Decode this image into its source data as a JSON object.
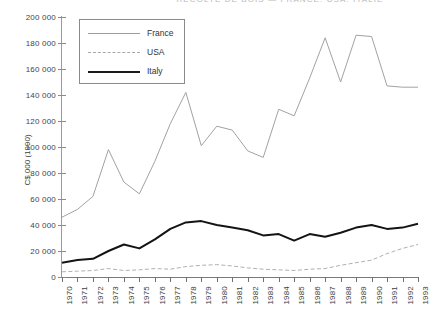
{
  "chart_data": {
    "type": "line",
    "title": "RÉCOLTE DE BOIS — FRANCE, USA, ITALIE",
    "xlabel": "",
    "ylabel": "C$ 000 (1990)",
    "ylim": [
      0,
      200000
    ],
    "ytick_step": 20000,
    "grid": false,
    "legend_position": "top-left",
    "ytick_labels": [
      "0",
      "20 000",
      "40 000",
      "60 000",
      "80 000",
      "100 000",
      "120 000",
      "140 000",
      "160 000",
      "180 000",
      "200 000"
    ],
    "ytick_values": [
      0,
      20000,
      40000,
      60000,
      80000,
      100000,
      120000,
      140000,
      160000,
      180000,
      200000
    ],
    "categories": [
      "1970",
      "1971",
      "1972",
      "1973",
      "1974",
      "1975",
      "1976",
      "1977",
      "1978",
      "1979",
      "1980",
      "1981",
      "1982",
      "1983",
      "1984",
      "1985",
      "1986",
      "1987",
      "1988",
      "1989",
      "1990",
      "1991",
      "1992",
      "1993"
    ],
    "series": [
      {
        "name": "France",
        "style": "solid-thin",
        "color": "#a2a2a2",
        "values": [
          46000,
          52000,
          62000,
          98000,
          73000,
          64000,
          89000,
          118000,
          142000,
          101000,
          116000,
          113000,
          97000,
          92000,
          129000,
          124000,
          153000,
          184000,
          150000,
          186000,
          185000,
          147000,
          146000,
          146000
        ]
      },
      {
        "name": "USA",
        "style": "dashed",
        "color": "#b0b0b0",
        "values": [
          4000,
          4500,
          5000,
          6500,
          5000,
          5500,
          6500,
          6000,
          8000,
          9000,
          9500,
          8500,
          7000,
          6000,
          5500,
          5000,
          6000,
          6500,
          9000,
          11000,
          13000,
          18000,
          22000,
          25000
        ]
      },
      {
        "name": "Italy",
        "style": "solid-thick",
        "color": "#141414",
        "values": [
          11000,
          13000,
          14000,
          20000,
          25000,
          22000,
          29000,
          37000,
          42000,
          43000,
          40000,
          38000,
          36000,
          32000,
          33000,
          28000,
          33000,
          31000,
          34000,
          38000,
          40000,
          37000,
          38000,
          41000
        ]
      }
    ]
  },
  "legend": {
    "items": [
      {
        "label": "France"
      },
      {
        "label": "USA"
      },
      {
        "label": "Italy"
      }
    ]
  }
}
